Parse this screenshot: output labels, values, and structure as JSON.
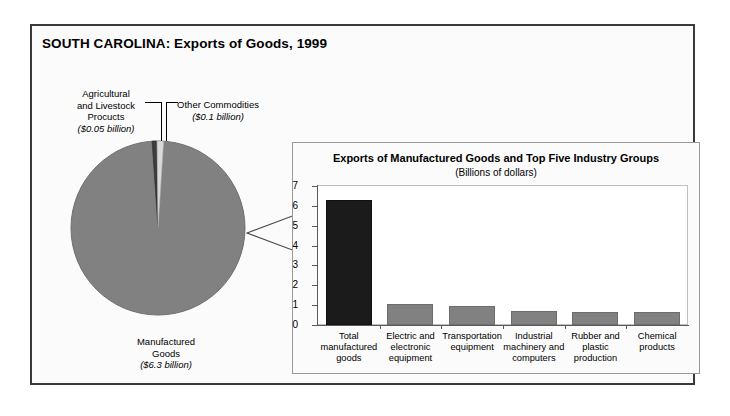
{
  "title": "SOUTH CAROLINA: Exports of Goods, 1999",
  "pie": {
    "slices": [
      {
        "name": "Manufactured Goods",
        "label_line1": "Manufactured",
        "label_line2": "Goods",
        "amount": "($6.3 billion)",
        "value": 6.3,
        "color": "#818181"
      },
      {
        "name": "Agricultural and Livestock Procucts",
        "label_line1": "Agricultural",
        "label_line2": "and Livestock",
        "label_line3": "Procucts",
        "amount": "($0.05 billion)",
        "value": 0.05,
        "color": "#3c3c3c"
      },
      {
        "name": "Other Commodities",
        "label_line1": "Other Commodities",
        "amount": "($0.1 billion)",
        "value": 0.1,
        "color": "#d6d6d6"
      }
    ]
  },
  "panel": {
    "title": "Exports of Manufactured Goods and Top Five Industry Groups",
    "subtitle": "(Billions of dollars)"
  },
  "chart_data": {
    "type": "bar",
    "title": "Exports of Manufactured Goods and Top Five Industry Groups",
    "subtitle": "(Billions of dollars)",
    "xlabel": "",
    "ylabel": "",
    "ylim": [
      0,
      7
    ],
    "yticks": [
      0,
      1,
      2,
      3,
      4,
      5,
      6,
      7
    ],
    "grid": false,
    "categories": [
      "Total manufactured goods",
      "Electric and electronic equipment",
      "Transportation equipment",
      "Industrial machinery and computers",
      "Rubber and plastic production",
      "Chemical products"
    ],
    "category_lines": [
      [
        "Total",
        "manufactured",
        "goods"
      ],
      [
        "Electric and",
        "electronic",
        "equipment"
      ],
      [
        "Transportation",
        "equipment"
      ],
      [
        "Industrial",
        "machinery and",
        "computers"
      ],
      [
        "Rubber and",
        "plastic",
        "production"
      ],
      [
        "Chemical",
        "products"
      ]
    ],
    "values": [
      6.3,
      1.05,
      0.95,
      0.7,
      0.68,
      0.65
    ],
    "colors": [
      "#1b1b1b",
      "#818181",
      "#818181",
      "#818181",
      "#818181",
      "#818181"
    ]
  },
  "pie_chart_data": {
    "type": "pie",
    "title": "SOUTH CAROLINA: Exports of Goods, 1999",
    "labels": [
      "Manufactured Goods",
      "Agricultural and Livestock Procucts",
      "Other Commodities"
    ],
    "values": [
      6.3,
      0.05,
      0.1
    ],
    "unit": "billions of dollars"
  }
}
